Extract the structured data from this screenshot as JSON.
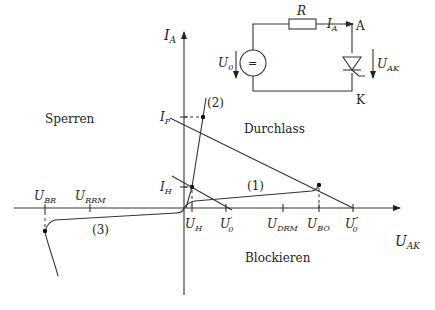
{
  "axes": {
    "y_label": "I",
    "y_label_sub": "A",
    "x_label": "U",
    "x_label_sub": "AK"
  },
  "regions": {
    "sperren": "Sperren",
    "durchlass": "Durchlass",
    "blockieren": "Blockieren"
  },
  "curves": {
    "c1": "(1)",
    "c2": "(2)",
    "c3": "(3)"
  },
  "y_ticks": [
    {
      "main": "I",
      "sub": "P"
    },
    {
      "main": "I",
      "sub": "H"
    }
  ],
  "x_ticks_positive": [
    {
      "main": "U",
      "sub": "H"
    },
    {
      "main": "U",
      "sub": "0",
      "prime": "′"
    },
    {
      "main": "U",
      "sub": "DRM"
    },
    {
      "main": "U",
      "sub": "BO"
    },
    {
      "main": "U",
      "sub": "0",
      "prime": "″"
    }
  ],
  "x_ticks_negative": [
    {
      "main": "U",
      "sub": "BR"
    },
    {
      "main": "U",
      "sub": "RRM"
    }
  ],
  "circuit": {
    "resistor": "R",
    "current": "I",
    "current_sub": "A",
    "anode": "A",
    "cathode": "K",
    "source": "U",
    "source_sub": "0",
    "source_symbol": "=",
    "voltage": "U",
    "voltage_sub": "AK"
  }
}
